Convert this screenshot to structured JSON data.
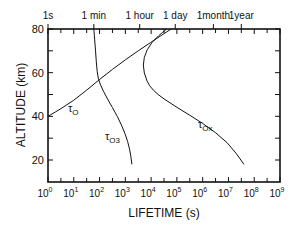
{
  "chart_data": {
    "type": "line",
    "title": "",
    "xlabel": "LIFETIME (s)",
    "ylabel": "ALTITUDE (km)",
    "xscale": "log",
    "xlim": [
      1,
      1000000000
    ],
    "ylim": [
      10,
      80
    ],
    "x_ticks": [
      "10^0",
      "10^1",
      "10^2",
      "10^3",
      "10^4",
      "10^5",
      "10^6",
      "10^7",
      "10^8",
      "10^9"
    ],
    "y_ticks": [
      "20",
      "40",
      "60",
      "80"
    ],
    "top_axis_ticks": [
      {
        "label": "1s",
        "seconds": 1
      },
      {
        "label": "1 min",
        "seconds": 60
      },
      {
        "label": "1 hour",
        "seconds": 3600
      },
      {
        "label": "1 day",
        "seconds": 86400
      },
      {
        "label": "1month",
        "seconds": 2600000
      },
      {
        "label": "1year",
        "seconds": 31500000
      }
    ],
    "grid": false,
    "series": [
      {
        "name": "τO",
        "label_main": "τ",
        "label_sub": "O",
        "points": [
          [
            1,
            40
          ],
          [
            10,
            47
          ],
          [
            100,
            57
          ],
          [
            1000,
            66
          ],
          [
            10000,
            74
          ],
          [
            60000,
            80
          ]
        ]
      },
      {
        "name": "τO3",
        "label_main": "τ",
        "label_sub": "O3",
        "points": [
          [
            60,
            80
          ],
          [
            70,
            70
          ],
          [
            80,
            60
          ],
          [
            100,
            55
          ],
          [
            200,
            48
          ],
          [
            500,
            40
          ],
          [
            1000,
            32
          ],
          [
            1500,
            25
          ],
          [
            1800,
            18
          ]
        ]
      },
      {
        "name": "τOx",
        "label_main": "τ",
        "label_sub": "Ox",
        "points": [
          [
            40000,
            80
          ],
          [
            10000,
            74
          ],
          [
            5000,
            67
          ],
          [
            5000,
            60
          ],
          [
            10000,
            52
          ],
          [
            100000,
            44
          ],
          [
            1000000,
            37
          ],
          [
            10000000,
            28
          ],
          [
            40000000,
            18
          ]
        ]
      }
    ]
  }
}
